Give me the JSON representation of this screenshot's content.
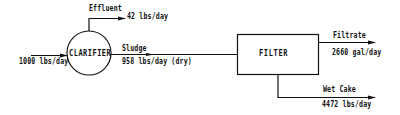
{
  "diagram": {
    "type": "process-flow",
    "colors": {
      "line": "#111111",
      "background": "#ffffff"
    },
    "nodes": {
      "clarifier": {
        "label": "CLARIFIER",
        "shape": "circle"
      },
      "filter": {
        "label": "FILTER",
        "shape": "rectangle"
      }
    },
    "streams": {
      "input": {
        "value": "1000 lbs/day"
      },
      "effluent": {
        "name": "Effluent",
        "value": "42 lbs/day"
      },
      "sludge": {
        "name": "Sludge",
        "value": "958 lbs/day (dry)"
      },
      "filtrate": {
        "name": "Filtrate",
        "value": "2660 gal/day"
      },
      "wet_cake": {
        "name": "Wet Cake",
        "value": "4472 lbs/day"
      }
    },
    "edges": [
      {
        "from": "input",
        "to": "clarifier",
        "label": "1000 lbs/day"
      },
      {
        "from": "clarifier",
        "to": "effluent",
        "label": "Effluent 42 lbs/day"
      },
      {
        "from": "clarifier",
        "to": "filter",
        "label": "Sludge 958 lbs/day (dry)"
      },
      {
        "from": "filter",
        "to": "filtrate",
        "label": "Filtrate 2660 gal/day"
      },
      {
        "from": "filter",
        "to": "wet_cake",
        "label": "Wet Cake 4472 lbs/day"
      }
    ]
  }
}
